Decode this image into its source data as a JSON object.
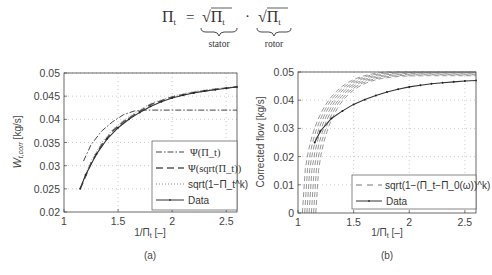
{
  "equation": {
    "lhs": "Π",
    "lhs_sub": "t",
    "eq": "=",
    "term1": "√Π",
    "term1_sub": "t",
    "dot": "·",
    "term2": "√Π",
    "term2_sub": "t",
    "brace1_label": "stator",
    "brace2_label": "rotor"
  },
  "chart_data": [
    {
      "type": "line",
      "panel_label": "(a)",
      "xlabel": "1/Π",
      "xlabel_sub": "t",
      "xlabel_suffix": " [–]",
      "ylabel": "W",
      "ylabel_sub": "t,corr",
      "ylabel_suffix": " [kg/s]",
      "xlim": [
        1,
        2.6
      ],
      "ylim": [
        0.02,
        0.05
      ],
      "xticks": [
        1,
        1.5,
        2,
        2.5
      ],
      "xtick_labels": [
        "1",
        "1.5",
        "2",
        "2.5"
      ],
      "yticks": [
        0.02,
        0.025,
        0.03,
        0.035,
        0.04,
        0.045,
        0.05
      ],
      "ytick_labels": [
        "0.02",
        "0.025",
        "0.03",
        "0.035",
        "0.04",
        "0.045",
        "0.05"
      ],
      "grid": true,
      "legend_position": "bottom-right",
      "legend": [
        "Ψ(Π_t)",
        "Ψ(sqrt(Π_t))",
        "sqrt(1−Π_t^k)",
        "Data"
      ],
      "series": [
        {
          "name": "Ψ(Π_t)",
          "style": "dashdot",
          "x": [
            1.18,
            1.25,
            1.35,
            1.45,
            1.55,
            1.65,
            1.75,
            1.85,
            2.0,
            2.2,
            2.4,
            2.6
          ],
          "y": [
            0.031,
            0.0345,
            0.0375,
            0.0395,
            0.041,
            0.0418,
            0.042,
            0.042,
            0.042,
            0.042,
            0.042,
            0.042
          ]
        },
        {
          "name": "Ψ(sqrt(Π_t))",
          "style": "dashed",
          "x": [
            1.15,
            1.25,
            1.35,
            1.45,
            1.55,
            1.65,
            1.8,
            2.0,
            2.2,
            2.4,
            2.6
          ],
          "y": [
            0.025,
            0.0305,
            0.0345,
            0.0375,
            0.0395,
            0.041,
            0.0432,
            0.0448,
            0.0458,
            0.0465,
            0.047
          ]
        },
        {
          "name": "sqrt(1−Π_t^k)",
          "style": "dotted",
          "x": [
            1.15,
            1.25,
            1.35,
            1.45,
            1.55,
            1.65,
            1.8,
            2.0,
            2.2,
            2.4,
            2.6
          ],
          "y": [
            0.0252,
            0.031,
            0.035,
            0.0378,
            0.0398,
            0.0413,
            0.0434,
            0.045,
            0.046,
            0.0466,
            0.0471
          ]
        },
        {
          "name": "Data",
          "style": "solid-marker",
          "x": [
            1.15,
            1.2,
            1.3,
            1.4,
            1.5,
            1.6,
            1.7,
            1.8,
            1.9,
            2.0,
            2.1,
            2.2,
            2.3,
            2.4,
            2.5,
            2.6
          ],
          "y": [
            0.025,
            0.028,
            0.0325,
            0.0358,
            0.0382,
            0.04,
            0.0415,
            0.0428,
            0.0438,
            0.0446,
            0.0452,
            0.0457,
            0.0461,
            0.0464,
            0.0467,
            0.047
          ]
        }
      ]
    },
    {
      "type": "line",
      "panel_label": "(b)",
      "xlabel": "1/Π",
      "xlabel_sub": "t",
      "xlabel_suffix": " [–]",
      "ylabel": "Corrected flow [kg/s]",
      "xlim": [
        1,
        2.6
      ],
      "ylim": [
        0,
        0.05
      ],
      "xticks": [
        1,
        1.5,
        2,
        2.5
      ],
      "xtick_labels": [
        "1",
        "1.5",
        "2",
        "2.5"
      ],
      "yticks": [
        0,
        0.01,
        0.02,
        0.03,
        0.04,
        0.05
      ],
      "ytick_labels": [
        "0",
        "0.01",
        "0.02",
        "0.03",
        "0.04",
        "0.05"
      ],
      "grid": true,
      "legend_position": "bottom-right",
      "legend": [
        "sqrt(1−(Π_t−Π_0(ω))^k)",
        "Data"
      ],
      "model_family": {
        "name": "sqrt(1−(Π_t−Π_0(ω))^k)",
        "style": "dashed",
        "x0_values": [
          1.04,
          1.06,
          1.08,
          1.1,
          1.12,
          1.14,
          1.16
        ],
        "ymax_values": [
          0.0505,
          0.0502,
          0.0499,
          0.0496,
          0.0493,
          0.049,
          0.0487
        ]
      },
      "series": [
        {
          "name": "Data",
          "style": "solid-marker",
          "x": [
            1.15,
            1.2,
            1.3,
            1.4,
            1.5,
            1.6,
            1.7,
            1.8,
            1.9,
            2.0,
            2.1,
            2.2,
            2.3,
            2.4,
            2.5,
            2.6
          ],
          "y": [
            0.025,
            0.029,
            0.0335,
            0.0362,
            0.0385,
            0.0402,
            0.0417,
            0.0429,
            0.0439,
            0.0447,
            0.0453,
            0.0458,
            0.0462,
            0.0465,
            0.0468,
            0.047
          ]
        }
      ]
    }
  ]
}
